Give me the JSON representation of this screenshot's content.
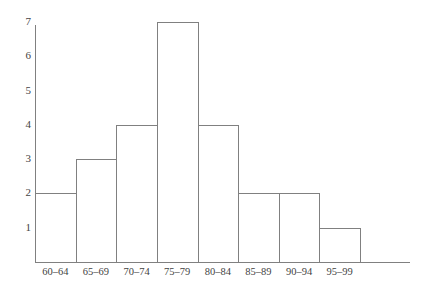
{
  "chart_data": {
    "type": "bar",
    "title": "",
    "subtitle": "",
    "xlabel": "",
    "ylabel": "",
    "categories": [
      "60–64",
      "65–69",
      "70–74",
      "75–79",
      "80–84",
      "85–89",
      "90–94",
      "95–99"
    ],
    "values": [
      2,
      3,
      4,
      7,
      4,
      2,
      2,
      1
    ],
    "y_ticks": [
      1,
      2,
      3,
      4,
      5,
      6,
      7
    ],
    "ylim": [
      0,
      7
    ],
    "grid": false,
    "legend": null,
    "annotations": [],
    "bar_style": {
      "fill": "#ffffff",
      "outline": "#808080",
      "gap": 0
    },
    "axis_color": "#808080",
    "text_color": "#3f3f3f",
    "background": "#ffffff"
  }
}
